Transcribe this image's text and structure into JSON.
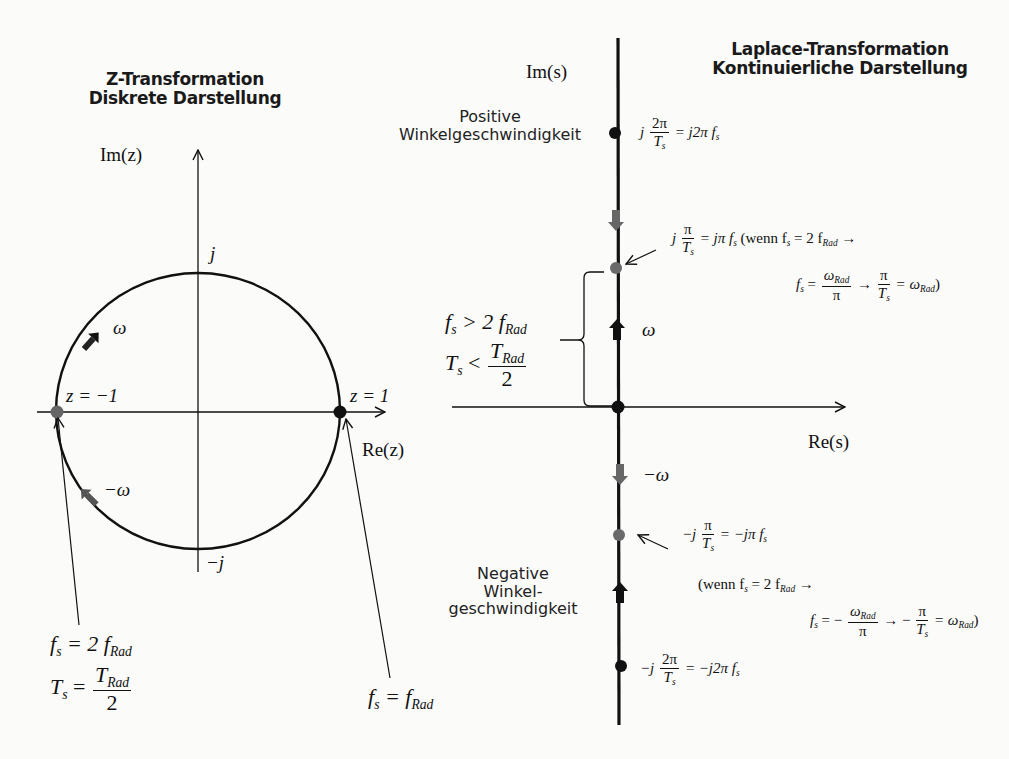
{
  "z_plane": {
    "title_line1": "Z-Transformation",
    "title_line2": "Diskrete Darstellung",
    "axis_im": "Im(z)",
    "axis_re": "Re(z)",
    "label_j": "j",
    "label_minus_j": "−j",
    "label_z_minus1": "z = −1",
    "label_z_plus1": "z = 1",
    "label_omega": "ω",
    "label_minus_omega": "−ω",
    "note_left": {
      "line1_lhs": "f",
      "line1_sub": "s",
      "line1_rhs": "= 2 f",
      "line1_rhs_sub": "Rad",
      "line2_lhs": "T",
      "line2_sub": "s",
      "line2_eq": "=",
      "line2_num": "T",
      "line2_num_sub": "Rad",
      "line2_den": "2"
    },
    "note_right": {
      "lhs": "f",
      "lhs_sub": "s",
      "eq": "= f",
      "rhs_sub": "Rad"
    },
    "colors": {
      "curve": "#111111",
      "point_z1": "#111111",
      "point_zm1": "#666666",
      "arrow_grey": "#555555"
    }
  },
  "s_plane": {
    "title_line1": "Laplace-Transformation",
    "title_line2": "Kontinuierliche Darstellung",
    "axis_im": "Im(s)",
    "axis_re": "Re(s)",
    "label_omega": "ω",
    "label_minus_omega": "−ω",
    "positive_label_line1": "Positive",
    "positive_label_line2": "Winkelgeschwindigkeit",
    "negative_label_line1": "Negative",
    "negative_label_line2": "Winkel-",
    "negative_label_line3": "geschwindigkeit",
    "brace_note": {
      "line1_lhs": "f",
      "line1_sub": "s",
      "line1_rhs": "> 2 f",
      "line1_rhs_sub": "Rad",
      "line2_lhs": "T",
      "line2_sub": "s",
      "line2_op": "<",
      "line2_num": "T",
      "line2_num_sub": "Rad",
      "line2_den": "2"
    },
    "points": [
      {
        "id": "j2pi",
        "text_prefix": "j",
        "num": "2π",
        "den": "T",
        "den_sub": "s",
        "rhs": "= j2π f",
        "rhs_sub": "s"
      },
      {
        "id": "jpi",
        "text_prefix": "j",
        "num": "π",
        "den": "T",
        "den_sub": "s",
        "rhs": "= jπ f",
        "rhs_sub": "s",
        "cond_open": "(wenn f",
        "cond_sub": "s",
        "cond_mid": "= 2 f",
        "cond_sub2": "Rad",
        "cond_arrow": "→",
        "line2_lhs": "f",
        "line2_lhs_sub": "s",
        "line2_eq": "=",
        "line2_num": "ω",
        "line2_num_sub": "Rad",
        "line2_den": "π",
        "line2_arrow": "→",
        "line2_num2": "π",
        "line2_den2": "T",
        "line2_den2_sub": "s",
        "line2_tail": "= ω",
        "line2_tail_sub": "Rad",
        "line2_close": ")"
      },
      {
        "id": "mjpi",
        "text_prefix": "−j",
        "num": "π",
        "den": "T",
        "den_sub": "s",
        "rhs": "= −jπ f",
        "rhs_sub": "s",
        "cond_open": "(wenn f",
        "cond_sub": "s",
        "cond_mid": "= 2 f",
        "cond_sub2": "Rad",
        "cond_arrow": "→",
        "line2_lhs": "f",
        "line2_lhs_sub": "s",
        "line2_eq": "= −",
        "line2_num": "ω",
        "line2_num_sub": "Rad",
        "line2_den": "π",
        "line2_arrow": "→ −",
        "line2_num2": "π",
        "line2_den2": "T",
        "line2_den2_sub": "s",
        "line2_tail": "= ω",
        "line2_tail_sub": "Rad",
        "line2_close": ")"
      },
      {
        "id": "mj2pi",
        "text_prefix": "−j",
        "num": "2π",
        "den": "T",
        "den_sub": "s",
        "rhs": "= −j2π f",
        "rhs_sub": "s"
      }
    ],
    "colors": {
      "axis": "#111111",
      "point_black": "#111111",
      "point_grey": "#6a6a6a",
      "arrow_black": "#111111",
      "arrow_grey": "#666666"
    }
  }
}
